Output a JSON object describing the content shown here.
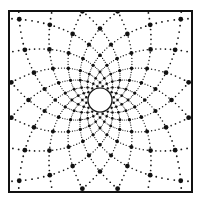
{
  "diagram": {
    "kind": "logarithmic-spiral-grid",
    "spiral_families": 2,
    "arms_per_family": 16,
    "colors": {
      "ink": "#111111",
      "background": "#ffffff",
      "center_fill": "#ffffff"
    }
  }
}
